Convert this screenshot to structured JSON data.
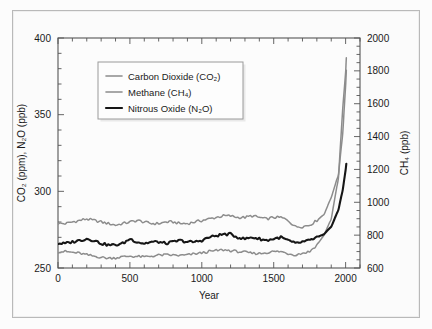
{
  "figure": {
    "background_color": "#fbfbfb",
    "frame_color": "#b9b9b9"
  },
  "axes": {
    "left": {
      "label": "CO₂ (ppm), N₂O (ppb)",
      "ticks": [
        "250",
        "300",
        "350",
        "400"
      ],
      "min": 250,
      "max": 400,
      "minor_step": 10
    },
    "right": {
      "label": "CH₄ (ppb)",
      "ticks": [
        "600",
        "800",
        "1000",
        "1200",
        "1400",
        "1600",
        "1800",
        "2000"
      ],
      "min": 600,
      "max": 2000,
      "minor_step": 50
    },
    "bottom": {
      "label": "Year",
      "ticks": [
        "0",
        "500",
        "1000",
        "1500",
        "2000"
      ],
      "min": 0,
      "max": 2100,
      "minor_step": 100
    }
  },
  "legend": {
    "entries": [
      {
        "label": "Carbon Dioxide (CO₂)",
        "color": "#8c8c8c",
        "width": 1.6
      },
      {
        "label": "Methane (CH₄)",
        "color": "#8c8c8c",
        "width": 1.6
      },
      {
        "label": "Nitrous Oxide (N₂O)",
        "color": "#161616",
        "width": 2.2
      }
    ],
    "box_color": "#fdfdfd",
    "border_color": "#9a9a9a"
  },
  "chart_data": {
    "type": "line",
    "title": "",
    "xlabel": "Year",
    "ylabel": "CO₂ (ppm), N₂O (ppb)",
    "ylabel_right": "CH₄ (ppb)",
    "xlim": [
      0,
      2100
    ],
    "ylim": [
      250,
      400
    ],
    "ylim_right": [
      600,
      2000
    ],
    "grid": false,
    "legend_position": "upper-left-inside",
    "series": [
      {
        "name": "Carbon Dioxide (CO₂)",
        "unit": "ppm",
        "axis": "left",
        "color": "#8c8c8c",
        "x": [
          0,
          50,
          100,
          150,
          200,
          250,
          300,
          350,
          400,
          450,
          500,
          550,
          600,
          650,
          700,
          750,
          800,
          850,
          900,
          950,
          1000,
          1050,
          1100,
          1150,
          1200,
          1250,
          1300,
          1350,
          1400,
          1450,
          1500,
          1550,
          1600,
          1650,
          1700,
          1750,
          1800,
          1850,
          1900,
          1950,
          1980,
          2000,
          2005
        ],
        "y": [
          279,
          279,
          280,
          281,
          282,
          281,
          280,
          279,
          278,
          279,
          280,
          281,
          280,
          279,
          279,
          280,
          280,
          279,
          279,
          280,
          281,
          282,
          283,
          284,
          284,
          283,
          283,
          284,
          283,
          282,
          283,
          283,
          281,
          277,
          277,
          278,
          281,
          285,
          296,
          311,
          338,
          369,
          379
        ]
      },
      {
        "name": "Methane (CH₄)",
        "unit": "ppb",
        "axis": "right",
        "color": "#8c8c8c",
        "x": [
          0,
          50,
          100,
          150,
          200,
          250,
          300,
          350,
          400,
          450,
          500,
          550,
          600,
          650,
          700,
          750,
          800,
          850,
          900,
          950,
          1000,
          1050,
          1100,
          1150,
          1200,
          1250,
          1300,
          1350,
          1400,
          1450,
          1500,
          1550,
          1600,
          1650,
          1700,
          1750,
          1800,
          1850,
          1900,
          1950,
          1980,
          2000,
          2005
        ],
        "y": [
          700,
          700,
          695,
          690,
          680,
          672,
          665,
          660,
          662,
          668,
          672,
          670,
          668,
          672,
          678,
          680,
          678,
          676,
          680,
          686,
          692,
          700,
          706,
          710,
          706,
          700,
          696,
          690,
          688,
          694,
          700,
          700,
          688,
          680,
          690,
          700,
          740,
          800,
          900,
          1150,
          1570,
          1790,
          1880
        ]
      },
      {
        "name": "Nitrous Oxide (N₂O)",
        "unit": "ppb",
        "axis": "left",
        "color": "#161616",
        "x": [
          0,
          50,
          100,
          150,
          200,
          250,
          300,
          350,
          400,
          450,
          500,
          550,
          600,
          650,
          700,
          750,
          800,
          850,
          900,
          950,
          1000,
          1050,
          1100,
          1150,
          1200,
          1250,
          1300,
          1350,
          1400,
          1450,
          1500,
          1550,
          1600,
          1650,
          1700,
          1750,
          1800,
          1850,
          1900,
          1950,
          1980,
          2000,
          2005
        ],
        "y": [
          266,
          266,
          267,
          268,
          269,
          268,
          266,
          265,
          265,
          266,
          269,
          267,
          266,
          267,
          267,
          266,
          267,
          268,
          267,
          267,
          268,
          270,
          271,
          272,
          272,
          270,
          269,
          270,
          269,
          268,
          269,
          270,
          268,
          266,
          267,
          268,
          270,
          272,
          277,
          288,
          301,
          314,
          318
        ]
      }
    ]
  }
}
